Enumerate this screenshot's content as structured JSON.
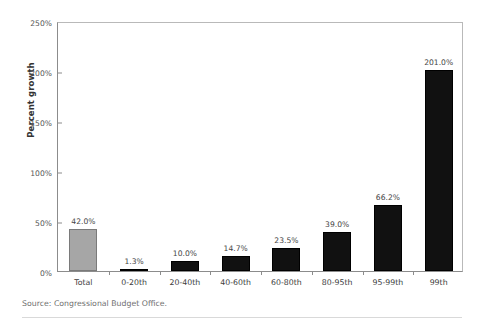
{
  "source_note": "Source: Congressional Budget Office.",
  "chart_data": {
    "type": "bar",
    "title": "",
    "xlabel": "",
    "ylabel": "Percent growth",
    "ylim": [
      0,
      250
    ],
    "yticks": [
      0,
      50,
      100,
      150,
      200,
      250
    ],
    "ytick_labels": [
      "0%",
      "50%",
      "100%",
      "150%",
      "200%",
      "250%"
    ],
    "grid": false,
    "legend": "none",
    "categories": [
      "Total",
      "0-20th",
      "20-40th",
      "40-60th",
      "60-80th",
      "80-95th",
      "95-99th",
      "99th"
    ],
    "values": [
      42.0,
      1.3,
      10.0,
      14.7,
      23.5,
      39.0,
      66.2,
      201.0
    ],
    "value_labels": [
      "42.0%",
      "1.3%",
      "10.0%",
      "14.7%",
      "23.5%",
      "39.0%",
      "66.2%",
      "201.0%"
    ],
    "bar_colors": [
      "#a6a6a6",
      "#111111",
      "#111111",
      "#111111",
      "#111111",
      "#111111",
      "#111111",
      "#111111"
    ],
    "bar_styles": [
      "grey",
      "dark",
      "dark",
      "dark",
      "dark",
      "dark",
      "dark",
      "dark"
    ]
  }
}
